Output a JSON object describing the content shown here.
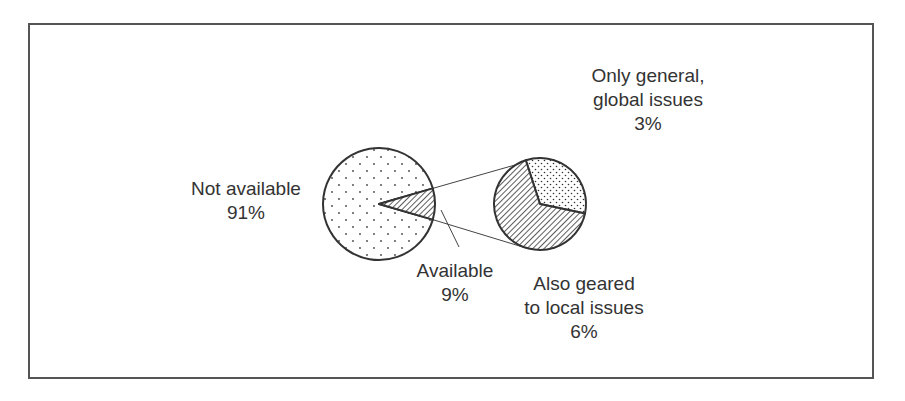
{
  "chart_data": {
    "type": "pie",
    "title": "",
    "main_pie": {
      "slices": [
        {
          "label": "Not available",
          "value": 91,
          "value_label": "91%",
          "pattern": "dots"
        },
        {
          "label": "Available",
          "value": 9,
          "value_label": "9%",
          "pattern": "hatch",
          "exploded_to_secondary": true
        }
      ]
    },
    "secondary_pie": {
      "parent": "Available",
      "slices": [
        {
          "label": "Only general, global issues",
          "label_lines": [
            "Only general,",
            "global issues"
          ],
          "value": 3,
          "value_label": "3%",
          "pattern": "fine-dots"
        },
        {
          "label": "Also geared to local issues",
          "label_lines": [
            "Also geared",
            "to local issues"
          ],
          "value": 6,
          "value_label": "6%",
          "pattern": "hatch"
        }
      ]
    },
    "colors": {
      "stroke": "#333333",
      "text": "#333333",
      "background": "#ffffff",
      "border": "#555555"
    }
  }
}
